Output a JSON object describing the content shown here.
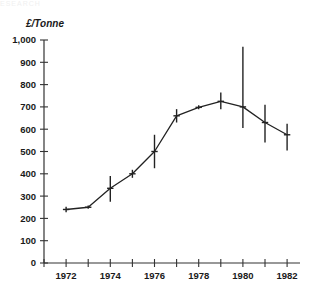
{
  "figure": {
    "scan_artifact_text": "ESEARCH",
    "background_color": "#ffffff",
    "ink_color": "#222222"
  },
  "chart_data": {
    "type": "line",
    "title": "",
    "subtitle": "",
    "xlabel": "",
    "ylabel": "£/Tonne",
    "ylabel_style": "bold-italic",
    "grid": false,
    "legend": "none",
    "xlim": [
      1971,
      1982.6
    ],
    "ylim": [
      0,
      1000
    ],
    "y_tick_step": 100,
    "y_ticks": [
      0,
      100,
      200,
      300,
      400,
      500,
      600,
      700,
      800,
      900,
      1000
    ],
    "y_tick_labels": [
      "0",
      "100",
      "200",
      "300",
      "400",
      "500",
      "600",
      "700",
      "800",
      "900",
      "1,000"
    ],
    "x_ticks": [
      1971,
      1972,
      1973,
      1974,
      1975,
      1976,
      1977,
      1978,
      1979,
      1980,
      1981,
      1982
    ],
    "x_tick_labels_shown": [
      "1972",
      "1974",
      "1976",
      "1978",
      "1980",
      "1982"
    ],
    "x_labeled_ticks": [
      1972,
      1974,
      1976,
      1978,
      1980,
      1982
    ],
    "x": [
      1972,
      1973,
      1974,
      1975,
      1976,
      1977,
      1978,
      1979,
      1980,
      1981,
      1982
    ],
    "values": [
      240,
      250,
      335,
      400,
      500,
      660,
      698,
      725,
      700,
      630,
      575
    ],
    "error_low": [
      228,
      243,
      275,
      382,
      425,
      630,
      690,
      690,
      605,
      540,
      505
    ],
    "error_high": [
      252,
      258,
      390,
      418,
      575,
      690,
      707,
      765,
      970,
      710,
      625
    ],
    "series": [
      {
        "name": "Price",
        "values": [
          240,
          250,
          335,
          400,
          500,
          660,
          698,
          725,
          700,
          630,
          575
        ]
      }
    ]
  }
}
